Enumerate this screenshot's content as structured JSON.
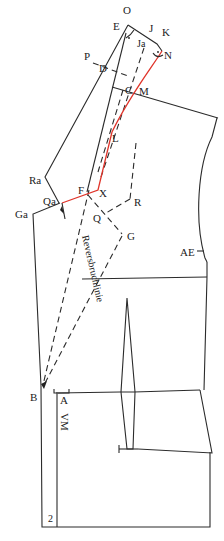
{
  "diagram": {
    "title": "",
    "colors": {
      "line": "#2b2b2b",
      "highlight": "#e0342a",
      "background": "#ffffff"
    },
    "labels": {
      "O": "O",
      "E": "E",
      "J": "J",
      "K": "K",
      "Ja": "Ja",
      "N": "N",
      "P": "P",
      "D": "D",
      "C": "C",
      "M": "M",
      "L": "L",
      "Ra": "Ra",
      "Qa": "Qa",
      "Ga": "Ga",
      "F": "F",
      "X": "X",
      "R": "R",
      "Q": "Q",
      "G": "G",
      "AE": "AE",
      "B": "B",
      "A": "A",
      "VM": "VM",
      "two": "2"
    },
    "rotated_text": "Reversbruchlinie"
  }
}
